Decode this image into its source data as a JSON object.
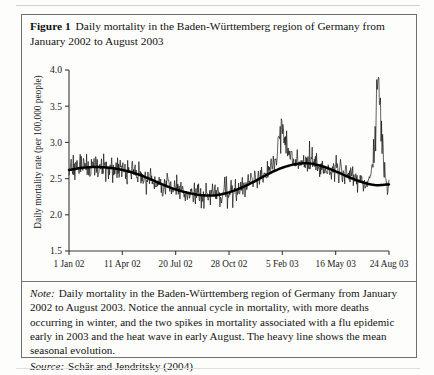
{
  "figure": {
    "number_label": "Figure 1",
    "caption": "Daily mortality in the Baden-Württemberg region of Germany from January 2002 to August 2003",
    "note_label": "Note:",
    "note_text": "Daily mortality in the Baden-Württemberg region of Germany from January 2002 to August 2003. Notice the annual cycle in mortality, with more deaths occurring in winter, and the two spikes in mortality associated with a flu epidemic early in 2003 and the heat wave in early August. The heavy line shows the mean seasonal evolution.",
    "source_label": "Source:",
    "source_text": "Schär and Jendritsky (2004)"
  },
  "chart_data": {
    "type": "line",
    "title": "Daily mortality in the Baden-Württemberg region of Germany from January 2002 to August 2003",
    "xlabel": "",
    "ylabel": "Daily mortality rate (per 100,000 people)",
    "ylim": [
      1.5,
      4.0
    ],
    "yticks": [
      1.5,
      2.0,
      2.5,
      3.0,
      3.5,
      4.0
    ],
    "ytick_labels": [
      "1.5",
      "2.0",
      "2.5",
      "3.0",
      "3.5",
      "4.0"
    ],
    "xlim": [
      0,
      600
    ],
    "xticks": [
      0,
      100,
      200,
      300,
      400,
      500,
      600
    ],
    "xtick_labels": [
      "1 Jan 02",
      "11 Apr 02",
      "20 Jul 02",
      "28 Oct 02",
      "5 Feb 03",
      "16 May 03",
      "24 Aug 03"
    ],
    "grid": false,
    "legend": null,
    "series": [
      {
        "name": "Daily mortality rate",
        "style": "thin-noisy-line",
        "color": "#000000",
        "description": "Daily observed mortality rate, highly variable day to day, ranging roughly 1.85 to 3.75 per 100,000.",
        "n_points": 601,
        "baseline_description": "Follows the seasonal mean with additive daily noise of about +/- 0.22, plus a flu spike near day 400 reaching 3.15 and a heat-wave spike near day 580 reaching 3.75."
      },
      {
        "name": "Mean seasonal evolution",
        "style": "heavy-smooth-line",
        "color": "#000000",
        "description": "Heavy smooth line showing the mean seasonal cycle.",
        "x": [
          0,
          25,
          50,
          75,
          100,
          125,
          150,
          175,
          200,
          225,
          250,
          275,
          300,
          325,
          350,
          375,
          400,
          425,
          450,
          475,
          500,
          525,
          550,
          575,
          600
        ],
        "y": [
          2.62,
          2.65,
          2.66,
          2.65,
          2.62,
          2.57,
          2.5,
          2.42,
          2.35,
          2.3,
          2.27,
          2.27,
          2.31,
          2.38,
          2.47,
          2.57,
          2.65,
          2.7,
          2.71,
          2.67,
          2.6,
          2.52,
          2.45,
          2.41,
          2.42
        ]
      }
    ],
    "annotations": [
      {
        "label": "flu epidemic spike",
        "x": 400,
        "y": 3.15
      },
      {
        "label": "heat wave spike",
        "x": 580,
        "y": 3.75
      }
    ]
  }
}
